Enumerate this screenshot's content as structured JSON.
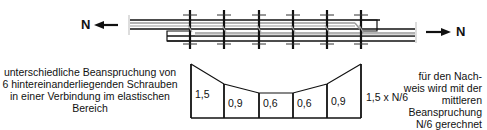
{
  "figure": {
    "force_label_left": "N",
    "force_label_right": "N",
    "description_left": "unterschiedliche Beanspruchung von 6 hintereinanderliegenden Schrauben in einer Verbindung im elastischen Bereich",
    "description_right": "für den Nach- weis wird mit der mittleren Beanspruchung N/6 gerechnet",
    "max_label": "1,5 x N/6",
    "bolt_count": 6,
    "bolt_loads": [
      "1,5",
      "0,9",
      "0,6",
      "0,6",
      "0,9"
    ],
    "colors": {
      "line": "#111111",
      "inner_plate": "#9a9a9a",
      "background": "#ffffff"
    }
  }
}
